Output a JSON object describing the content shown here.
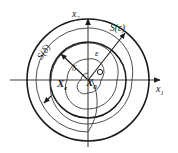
{
  "figure": {
    "kind": "phase-plane-stability-diagram",
    "background": "#ffffff",
    "stroke_color": "#1b1b1b",
    "thin_stroke_color": "#4a4a4a",
    "width": 178,
    "height": 153
  },
  "axes": {
    "x_label": "x",
    "x_subscript": "1",
    "y_label": "x",
    "y_subscript": "2",
    "origin": {
      "x": 88,
      "y": 80
    },
    "x_axis_from": {
      "x": 10,
      "y": 80
    },
    "x_axis_to": {
      "x": 166,
      "y": 80
    },
    "y_axis_from": {
      "x": 88,
      "y": 146
    },
    "y_axis_to": {
      "x": 88,
      "y": 14
    }
  },
  "circles": {
    "outer": {
      "name": "S",
      "arg": "ε",
      "label": "S(ε)",
      "radius": 61,
      "stroke_width": 1.5
    },
    "inner": {
      "name": "S",
      "arg": "δ",
      "label": "S(δ)",
      "radius": 38,
      "stroke_width": 1.5
    }
  },
  "radii": {
    "epsilon": {
      "label": "ε",
      "angle_deg": 52,
      "length": 61
    },
    "delta": {
      "label": "δ",
      "angle_deg": 138,
      "length": 38
    }
  },
  "points": {
    "initial": {
      "label": "X",
      "subscript": "e",
      "marker": "none"
    },
    "equilibrium": {
      "label": "X",
      "subscript": "0",
      "marker": "small-circle"
    }
  },
  "trajectory": {
    "type": "inward-spiral",
    "direction": "counter-clockwise",
    "arrow_at": {
      "x": 44,
      "y": 101
    },
    "stroke_width": 0.8
  }
}
